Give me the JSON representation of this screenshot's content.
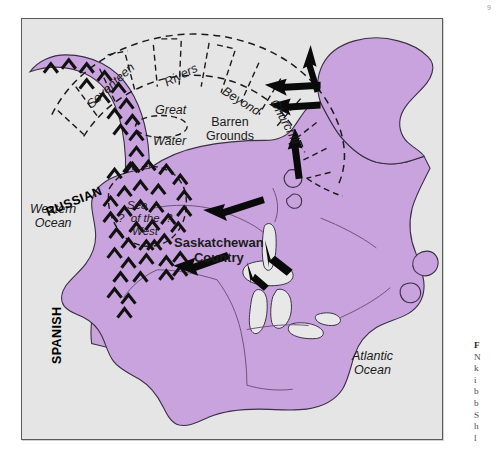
{
  "map": {
    "background_color": "#e5e5e5",
    "known_land_color": "#c9a3de",
    "border_color": "#5a5a5a",
    "ocean_labels": [
      {
        "name": "western-ocean",
        "line1": "Western",
        "line2": "Ocean"
      },
      {
        "name": "atlantic-ocean",
        "line1": "Atlantic",
        "line2": "Ocean"
      }
    ],
    "region_labels": {
      "barren_grounds_line1": "Barren",
      "barren_grounds_line2": "Grounds",
      "great": "Great",
      "water": "Water",
      "saskatchewan_line1": "Saskatchewan",
      "saskatchewan_line2": "Country"
    },
    "speculative_sea": {
      "line1": "Sea",
      "line2": "?  of the  ?",
      "line3": "West"
    },
    "river_arc_labels": [
      "Seventeen",
      "Rivers",
      "Beyond",
      "Churchill"
    ],
    "approach_arrows": [
      {
        "name": "russian",
        "label": "RUSSIAN"
      },
      {
        "name": "spanish",
        "label": "SPANISH"
      }
    ]
  },
  "legend": {
    "swatch_color": "#c9a3de",
    "label": "Known land"
  },
  "caption": {
    "lines": [
      "F",
      "N",
      "k",
      "i",
      "b",
      "b",
      "S",
      "h",
      "l"
    ]
  },
  "corner_mark": "9"
}
